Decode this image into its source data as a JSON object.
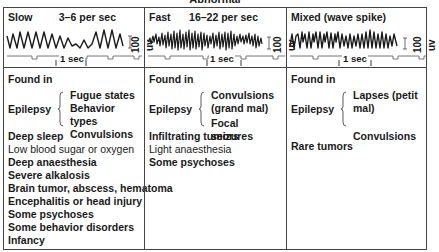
{
  "header": {
    "title": "Abnormal"
  },
  "columns": [
    {
      "name": "Slow",
      "rate": "3–6 per sec",
      "scale_label": "100 uv",
      "time_label": "1 sec",
      "found_in_label": "Found in",
      "epilepsy_label": "Epilepsy",
      "epilepsy_items": [
        "Fugue states",
        "Behavior types",
        "Convulsions"
      ],
      "conditions": [
        "Deep sleep",
        "Low blood sugar or oxygen",
        "Deep anaesthesia",
        "Severe alkalosis",
        "Brain tumor, abscess, hematoma",
        "Encephalitis or head injury",
        "Some psychoses",
        "Some behavior disorders",
        "Infancy"
      ]
    },
    {
      "name": "Fast",
      "rate": "16–22 per sec",
      "scale_label": "100 uv",
      "time_label": "1 sec",
      "found_in_label": "Found in",
      "epilepsy_label": "Epilepsy",
      "epilepsy_items": [
        "Convulsions",
        "(grand mal)",
        "Focal seizures"
      ],
      "conditions": [
        "Infiltrating tumors",
        "Light anaesthesia",
        "Some psychoses"
      ]
    },
    {
      "name": "Mixed (wave spike)",
      "rate": "",
      "scale_label": "100 uv",
      "time_label": "1 sec",
      "found_in_label": "Found in",
      "epilepsy_label": "Epilepsy",
      "epilepsy_items": [
        "Lapses (petit mal)",
        "",
        "Convulsions"
      ],
      "conditions": [
        "Rare tumors"
      ]
    }
  ],
  "colors": {
    "ink": "#1a1a1a",
    "rule": "#444444",
    "background": "#ffffff"
  }
}
